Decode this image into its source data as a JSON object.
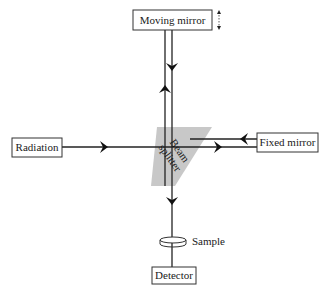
{
  "diagram": {
    "components": {
      "moving_mirror": "Moving mirror",
      "fixed_mirror": "Fixed mirror",
      "radiation": "Radiation",
      "beam_splitter_line1": "Beam",
      "beam_splitter_line2": "splitter",
      "sample": "Sample",
      "detector": "Detector"
    },
    "colors": {
      "line": "#222222",
      "beam_splitter_fill": "#c8c8c8",
      "box_stroke": "#333333"
    },
    "icons": {
      "movement_indicator": "double-arrow-vertical-icon",
      "arrowheads": "chevron-arrow-icon"
    }
  }
}
